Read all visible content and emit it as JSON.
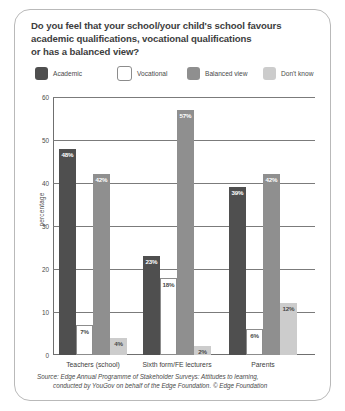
{
  "title": {
    "line1": "Do you feel that your school/your child's school favours",
    "line2": "academic qualifications, vocational qualifications",
    "line3": "or has a balanced view?"
  },
  "colors": {
    "academic": "#4f4f4f",
    "vocational": "#ffffff",
    "vocational_border": "#8c8c8c",
    "balanced": "#8f8f8f",
    "dont_know": "#cccccc",
    "axis": "#6f6f6f",
    "grid": "#7b7b7b",
    "panel_border": "#b9b9b9",
    "text": "#3d3d3d"
  },
  "source": {
    "line1": "Source: Edge Annual Programme of Stakeholder Surveys: Attitudes to learning,",
    "line2": "conducted by YouGov on behalf of the Edge Foundation. © Edge Foundation"
  },
  "chart_data": {
    "type": "bar",
    "title": "Do you feel that your school/your child's school favours academic qualifications, vocational qualifications or has a balanced view?",
    "xlabel": "",
    "ylabel": "percentage",
    "ylim": [
      0,
      60
    ],
    "yticks": [
      0,
      10,
      20,
      30,
      40,
      50,
      60
    ],
    "ytick_labels": [
      "0",
      "10",
      "20",
      "30",
      "40",
      "50",
      "60"
    ],
    "grid": true,
    "legend_position": "top",
    "categories": [
      "Teachers (school)",
      "Sixth form/FE lecturers",
      "Parents"
    ],
    "series": [
      {
        "name": "Academic",
        "color": "#4f4f4f",
        "values": [
          48,
          23,
          39
        ],
        "labels": [
          "48%",
          "23%",
          "39%"
        ]
      },
      {
        "name": "Vocational",
        "color": "#ffffff",
        "values": [
          7,
          18,
          6
        ],
        "labels": [
          "7%",
          "18%",
          "6%"
        ]
      },
      {
        "name": "Balanced view",
        "color": "#8f8f8f",
        "values": [
          42,
          57,
          42
        ],
        "labels": [
          "42%",
          "57%",
          "42%"
        ]
      },
      {
        "name": "Don't know",
        "color": "#cccccc",
        "values": [
          4,
          2,
          12
        ],
        "labels": [
          "4%",
          "2%",
          "12%"
        ]
      }
    ]
  }
}
